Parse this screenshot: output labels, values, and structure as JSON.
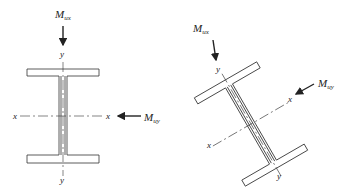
{
  "diagram": {
    "left": {
      "moment_top": {
        "main": "M",
        "sub": "ux"
      },
      "moment_right": {
        "main": "M",
        "sub": "uy"
      },
      "axis_y_top": "y",
      "axis_y_bottom": "y",
      "axis_x_left": "x",
      "axis_x_right": "x"
    },
    "right": {
      "moment_top": {
        "main": "M",
        "sub": "ux"
      },
      "moment_right": {
        "main": "M",
        "sub": "uy"
      },
      "axis_y_top": "y",
      "axis_y_bottom": "y",
      "axis_x_left": "x",
      "axis_x_right": "x",
      "rotation_deg": 30
    }
  }
}
